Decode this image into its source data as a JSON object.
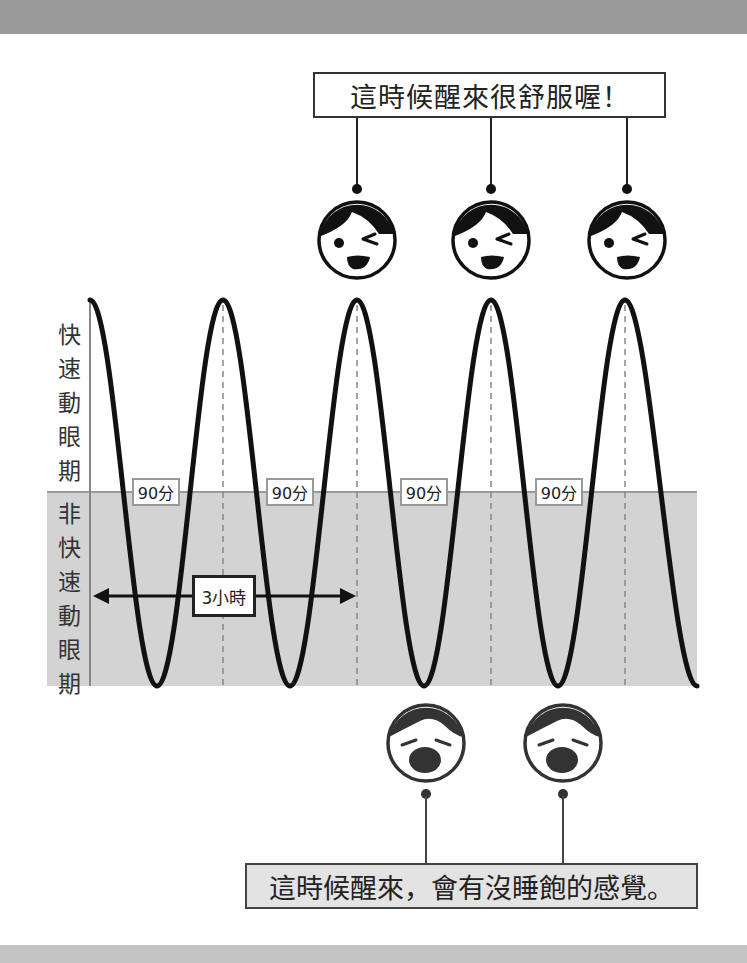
{
  "diagram": {
    "title_callout_good": "這時候醒來很舒服喔！",
    "title_callout_bad": "這時候醒來，會有沒睡飽的感覺。",
    "axis_labels": {
      "rem": [
        "快",
        "速",
        "動",
        "眼",
        "期"
      ],
      "nrem": [
        "非",
        "快",
        "速",
        "動",
        "眼",
        "期"
      ]
    },
    "cycle_labels": [
      "90分",
      "90分",
      "90分",
      "90分"
    ],
    "duration_label": "3小時",
    "faces": {
      "happy_count": 3,
      "sleepy_count": 2,
      "happy_icon": "winking-happy-face-icon",
      "sleepy_icon": "yawning-sleepy-face-icon"
    },
    "colors": {
      "curve": "#111111",
      "nrem_zone": "#d3d3d3",
      "band": "#9a9a9a"
    }
  }
}
